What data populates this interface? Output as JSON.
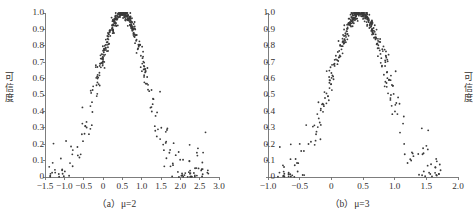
{
  "figure": {
    "background": "#ffffff",
    "point_color": "#3a3a3a",
    "axis_color": "#6f6f6f",
    "text_color": "#33312f"
  },
  "chart_data": [
    {
      "type": "scatter",
      "panel_id": "a",
      "title": "",
      "caption": "（a）μ=2",
      "caption_prefix": "（a）",
      "caption_symbol": "μ",
      "caption_value": "=2",
      "xlabel": "",
      "ylabel": "可信度",
      "ylabel_vertical": "可\n信\n度",
      "xlim": [
        -1.5,
        3.0
      ],
      "ylim": [
        0,
        1.0
      ],
      "xticks": [
        -1.5,
        -1.0,
        -0.5,
        0,
        0.5,
        1.0,
        1.5,
        2.0,
        2.5,
        3.0
      ],
      "xticklabels": [
        "−1.5",
        "−1.0",
        "−0.5",
        "0",
        "0.5",
        "1.0",
        "1.5",
        "2.0",
        "2.5",
        "3.0"
      ],
      "yticks": [
        0,
        0.1,
        0.2,
        0.3,
        0.4,
        0.5,
        0.6,
        0.7,
        0.8,
        0.9,
        1.0
      ],
      "yticklabels": [
        "0",
        "0.1",
        "0.2",
        "0.3",
        "0.4",
        "0.5",
        "0.6",
        "0.7",
        "0.8",
        "0.9",
        "1.0"
      ],
      "grid": false,
      "legend": null,
      "distribution": {
        "shape": "bell",
        "peak_x": 0.5,
        "peak_y": 1.0,
        "sigma": 0.62,
        "scatter_noise": 0.055,
        "n_points": 430,
        "x_spread": [
          -1.45,
          2.75
        ]
      }
    },
    {
      "type": "scatter",
      "panel_id": "b",
      "title": "",
      "caption": "（b）μ=3",
      "caption_prefix": "（b）",
      "caption_symbol": "μ",
      "caption_value": "=3",
      "xlabel": "",
      "ylabel": "可信度",
      "ylabel_vertical": "可\n信\n度",
      "xlim": [
        -1.0,
        2.0
      ],
      "ylim": [
        0,
        1.0
      ],
      "xticks": [
        -1.0,
        -0.5,
        0,
        0.5,
        1.0,
        1.5,
        2.0
      ],
      "xticklabels": [
        "−1.0",
        "−0.5",
        "0",
        "0.5",
        "1.0",
        "1.5",
        "2.0"
      ],
      "yticks": [
        0,
        0.1,
        0.2,
        0.3,
        0.4,
        0.5,
        0.6,
        0.7,
        0.8,
        0.9,
        1.0
      ],
      "yticklabels": [
        "0",
        "0.1",
        "0.2",
        "0.3",
        "0.4",
        "0.5",
        "0.6",
        "0.7",
        "0.8",
        "0.9",
        "1.0"
      ],
      "grid": false,
      "legend": null,
      "distribution": {
        "shape": "bell",
        "peak_x": 0.45,
        "peak_y": 1.0,
        "sigma": 0.45,
        "scatter_noise": 0.055,
        "n_points": 430,
        "x_spread": [
          -0.85,
          1.78
        ]
      }
    }
  ]
}
